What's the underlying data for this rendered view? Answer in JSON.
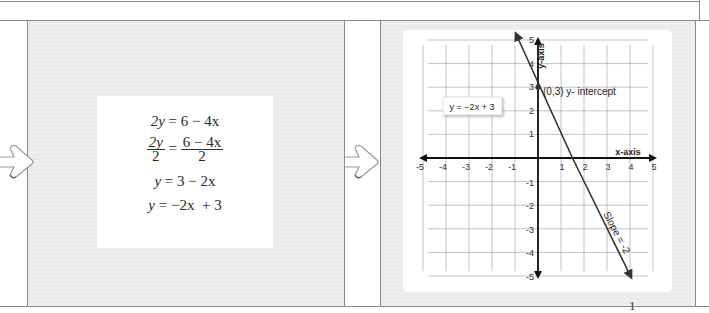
{
  "steps": {
    "equations": [
      {
        "type": "plain",
        "lhs": "2y",
        "rhs": "6 − 4x"
      },
      {
        "type": "fraction",
        "lhs_num": "2y",
        "lhs_den": "2",
        "rhs_num": "6 − 4x",
        "rhs_den": "2"
      },
      {
        "type": "plain",
        "lhs": "y",
        "rhs": "3 − 2x"
      },
      {
        "type": "plain",
        "lhs": "y",
        "rhs": "−2x  + 3"
      }
    ],
    "equals": "="
  },
  "chart_data": {
    "type": "line",
    "title": "",
    "xlabel": "x-axis",
    "ylabel": "y-axis",
    "xlim": [
      -5,
      5
    ],
    "ylim": [
      -5,
      5
    ],
    "grid": true,
    "x_ticks": [
      "-5",
      "-4",
      "-3",
      "-2",
      "-1",
      "1",
      "2",
      "3",
      "4",
      "5"
    ],
    "y_ticks": [
      "5",
      "4",
      "3",
      "2",
      "1",
      "-1",
      "-2",
      "-3",
      "-4",
      "-5"
    ],
    "series": [
      {
        "name": "y = −2x + 3",
        "slope": -2,
        "intercept": 3,
        "x": [
          -1,
          4
        ],
        "y": [
          5,
          -5
        ]
      }
    ],
    "legend_label": "y = −2x + 3",
    "annotations": [
      {
        "text": "(0,3) y- intercept",
        "point": [
          0,
          3
        ]
      },
      {
        "text": "Slope = -2"
      }
    ]
  },
  "page_number": "1"
}
